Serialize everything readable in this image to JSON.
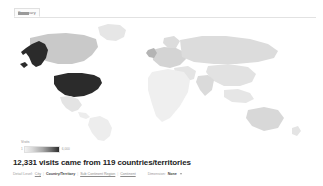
{
  "tabs": [
    {
      "label": "Summary",
      "selected": true
    }
  ],
  "map": {
    "regions": [
      {
        "name": "United States",
        "shade": "#2b2b2b",
        "level": "highest"
      },
      {
        "name": "Alaska",
        "shade": "#2b2b2b",
        "level": "highest"
      },
      {
        "name": "Canada",
        "shade": "#c9c9c9",
        "level": "medium"
      },
      {
        "name": "Greenland",
        "shade": "#e6e6e6",
        "level": "low"
      },
      {
        "name": "Mexico",
        "shade": "#e4e4e4",
        "level": "low"
      },
      {
        "name": "South America",
        "shade": "#ededed",
        "level": "lowest"
      },
      {
        "name": "Europe",
        "shade": "#d4d4d4",
        "level": "medium"
      },
      {
        "name": "United Kingdom",
        "shade": "#b4b4b4",
        "level": "medium"
      },
      {
        "name": "Africa",
        "shade": "#efefef",
        "level": "lowest"
      },
      {
        "name": "Russia",
        "shade": "#dcdcdc",
        "level": "low"
      },
      {
        "name": "Asia",
        "shade": "#e2e2e2",
        "level": "low"
      },
      {
        "name": "India",
        "shade": "#dadada",
        "level": "low"
      },
      {
        "name": "Australia",
        "shade": "#d8d8d8",
        "level": "low"
      }
    ],
    "ocean_color": "#ffffff",
    "land_default": "#e9e9e9"
  },
  "legend": {
    "title": "Visits",
    "min": "1",
    "max": "6,000",
    "gradient_from": "#f2f2f2",
    "gradient_to": "#2b2b2b"
  },
  "summary": {
    "headline": "12,331 visits came from 119 countries/territories",
    "detail_level_label": "Detail Level:",
    "levels": [
      {
        "label": "City",
        "current": false
      },
      {
        "label": "Country/Territory",
        "current": true
      },
      {
        "label": "Sub Continent Region",
        "current": false
      },
      {
        "label": "Continent",
        "current": false
      }
    ],
    "dimension_label": "Dimension:",
    "dimension_value": "None"
  }
}
